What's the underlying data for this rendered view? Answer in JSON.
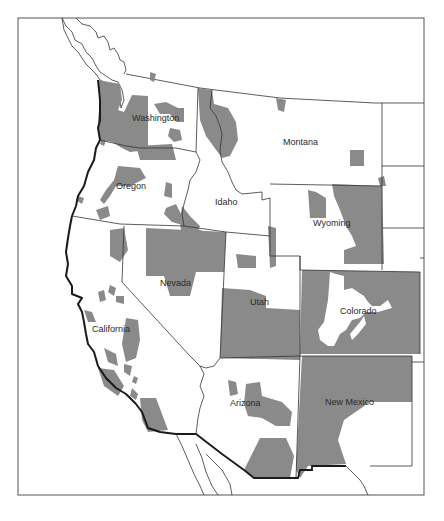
{
  "map": {
    "title": "",
    "shade_color": "#8a8a8a",
    "border_color": "#333333",
    "background_color": "#ffffff",
    "states": [
      {
        "name": "Washington",
        "x": 132,
        "y": 121
      },
      {
        "name": "Oregon",
        "x": 116,
        "y": 189
      },
      {
        "name": "California",
        "x": 92,
        "y": 332
      },
      {
        "name": "Idaho",
        "x": 215,
        "y": 205
      },
      {
        "name": "Nevada",
        "x": 160,
        "y": 286
      },
      {
        "name": "Montana",
        "x": 283,
        "y": 145
      },
      {
        "name": "Wyoming",
        "x": 313,
        "y": 226
      },
      {
        "name": "Utah",
        "x": 250,
        "y": 305
      },
      {
        "name": "Colorado",
        "x": 340,
        "y": 314
      },
      {
        "name": "Arizona",
        "x": 230,
        "y": 406
      },
      {
        "name": "New Mexico",
        "x": 325,
        "y": 405
      }
    ]
  }
}
